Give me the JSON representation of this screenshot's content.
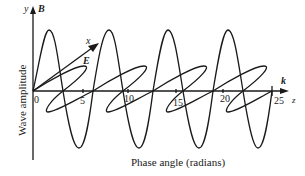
{
  "diagram": {
    "axis_y_label": "y",
    "axis_x_label": "x",
    "axis_z_label": "z",
    "field_B_label": "B",
    "field_E_label": "E",
    "wave_vector_label": "k",
    "ylabel": "Wave amplitude",
    "xlabel": "Phase angle (radians)",
    "ticks": [
      "0",
      "5",
      "10",
      "15",
      "20",
      "25"
    ]
  }
}
